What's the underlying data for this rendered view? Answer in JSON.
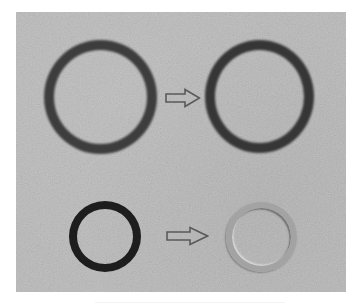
{
  "image": {
    "width": 361,
    "height": 305,
    "background_color": "#ffffff",
    "photo_area": {
      "x": 16,
      "y": 12,
      "width": 330,
      "height": 280,
      "color": "#b9b9b9"
    }
  },
  "scene": {
    "description": "Photograph of O-rings on a gray surface comparing before and after states",
    "rows": [
      {
        "name": "top-row",
        "before": {
          "label": "large-o-ring-before",
          "x": 44,
          "y": 40,
          "diameter": 113,
          "thickness": 10,
          "color": "#3c3c3c"
        },
        "arrow": {
          "x": 165,
          "y": 88,
          "width": 36,
          "height": 20,
          "color": "#595959"
        },
        "after": {
          "label": "large-o-ring-after",
          "x": 205,
          "y": 40,
          "diameter": 109,
          "thickness": 10,
          "color": "#353535"
        }
      },
      {
        "name": "bottom-row",
        "before": {
          "label": "small-o-ring-before",
          "x": 69,
          "y": 201,
          "diameter": 72,
          "thickness": 8,
          "color": "#1c1c1c"
        },
        "arrow": {
          "x": 166,
          "y": 226,
          "width": 43,
          "height": 20,
          "color": "#5a5a5a"
        },
        "after": {
          "label": "small-o-ring-after-faded",
          "x": 226,
          "y": 202,
          "diameter": 71,
          "thickness": 6,
          "color": "#9a9a9a"
        }
      }
    ]
  }
}
